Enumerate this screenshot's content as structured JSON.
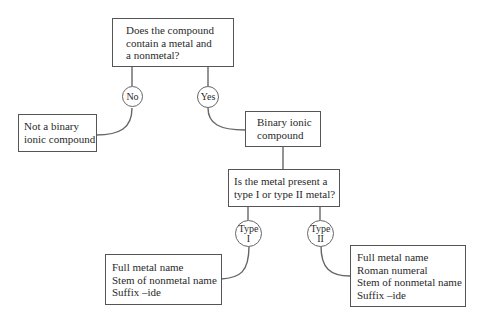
{
  "diagram": {
    "nodes": {
      "q1": {
        "lines": [
          "Does the compound",
          "contain a metal and",
          "a nonmetal?"
        ]
      },
      "no_label": {
        "lines": [
          "No"
        ]
      },
      "yes_label": {
        "lines": [
          "Yes"
        ]
      },
      "not_binary": {
        "lines": [
          "Not a binary",
          "ionic compound"
        ]
      },
      "binary": {
        "lines": [
          "Binary ionic",
          "compound"
        ]
      },
      "q2": {
        "lines": [
          "Is the metal present a",
          "type I or type II metal?"
        ]
      },
      "type1_label": {
        "lines": [
          "Type",
          "I"
        ]
      },
      "type2_label": {
        "lines": [
          "Type",
          "II"
        ]
      },
      "type1_result": {
        "lines": [
          "Full metal name",
          "Stem of nonmetal name",
          "Suffix –ide"
        ]
      },
      "type2_result": {
        "lines": [
          "Full metal name",
          "Roman numeral",
          "Stem of nonmetal name",
          "Suffix –ide"
        ]
      }
    },
    "edges": [
      {
        "from": "q1",
        "to": "not_binary",
        "label": "No"
      },
      {
        "from": "q1",
        "to": "binary",
        "label": "Yes"
      },
      {
        "from": "binary",
        "to": "q2"
      },
      {
        "from": "q2",
        "to": "type1_result",
        "label": "Type I"
      },
      {
        "from": "q2",
        "to": "type2_result",
        "label": "Type II"
      }
    ]
  }
}
